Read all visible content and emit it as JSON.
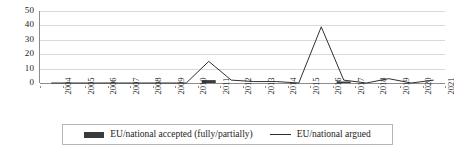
{
  "chart_data": {
    "type": "line",
    "title": "",
    "xlabel": "",
    "ylabel": "",
    "ylim": [
      0,
      50
    ],
    "yticks": [
      0,
      10,
      20,
      30,
      40,
      50
    ],
    "grid": true,
    "legend_position": "bottom",
    "categories": [
      "2004",
      "2005",
      "2006",
      "2007",
      "2008",
      "2009",
      "2010",
      "2011",
      "2012",
      "2013",
      "2014",
      "2015",
      "2016",
      "2017",
      "2018",
      "2019",
      "2020",
      "2021"
    ],
    "series": [
      {
        "name": "EU/national accepted (fully/partially)",
        "type": "bar",
        "color": "#3a3a3a",
        "values": [
          0,
          0,
          0,
          0,
          0,
          0,
          0,
          2,
          0,
          0,
          0,
          0,
          0,
          1,
          0,
          0,
          0,
          0
        ]
      },
      {
        "name": "EU/national argued",
        "type": "line",
        "color": "#303030",
        "values": [
          0,
          0,
          0,
          0,
          0,
          0,
          0,
          15,
          2,
          1,
          1,
          0,
          39,
          2,
          0,
          3,
          0,
          2
        ]
      }
    ]
  },
  "legend": {
    "entries": [
      {
        "label": "EU/national accepted (fully/partially)",
        "marker": "bar-swatch"
      },
      {
        "label": "EU/national argued",
        "marker": "line-swatch"
      }
    ]
  }
}
